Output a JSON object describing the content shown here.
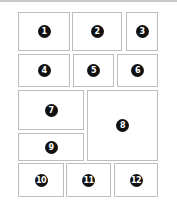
{
  "layout": {
    "title": "Panel layout diagram",
    "border_color": "#bdbdbd",
    "badge_color": "#111111"
  },
  "panels": [
    {
      "label": "1",
      "x": 18,
      "y": 12,
      "w": 52,
      "h": 39
    },
    {
      "label": "2",
      "x": 72,
      "y": 12,
      "w": 50,
      "h": 39
    },
    {
      "label": "3",
      "x": 126,
      "y": 12,
      "w": 32,
      "h": 39
    },
    {
      "label": "4",
      "x": 18,
      "y": 54,
      "w": 52,
      "h": 33
    },
    {
      "label": "5",
      "x": 73,
      "y": 54,
      "w": 41,
      "h": 33
    },
    {
      "label": "6",
      "x": 117,
      "y": 54,
      "w": 41,
      "h": 33
    },
    {
      "label": "7",
      "x": 18,
      "y": 90,
      "w": 66,
      "h": 40
    },
    {
      "label": "8",
      "x": 87,
      "y": 90,
      "w": 71,
      "h": 71
    },
    {
      "label": "9",
      "x": 18,
      "y": 133,
      "w": 66,
      "h": 28
    },
    {
      "label": "10",
      "x": 18,
      "y": 163,
      "w": 46,
      "h": 34
    },
    {
      "label": "11",
      "x": 66,
      "y": 163,
      "w": 45,
      "h": 34
    },
    {
      "label": "12",
      "x": 114,
      "y": 163,
      "w": 44,
      "h": 34
    }
  ]
}
